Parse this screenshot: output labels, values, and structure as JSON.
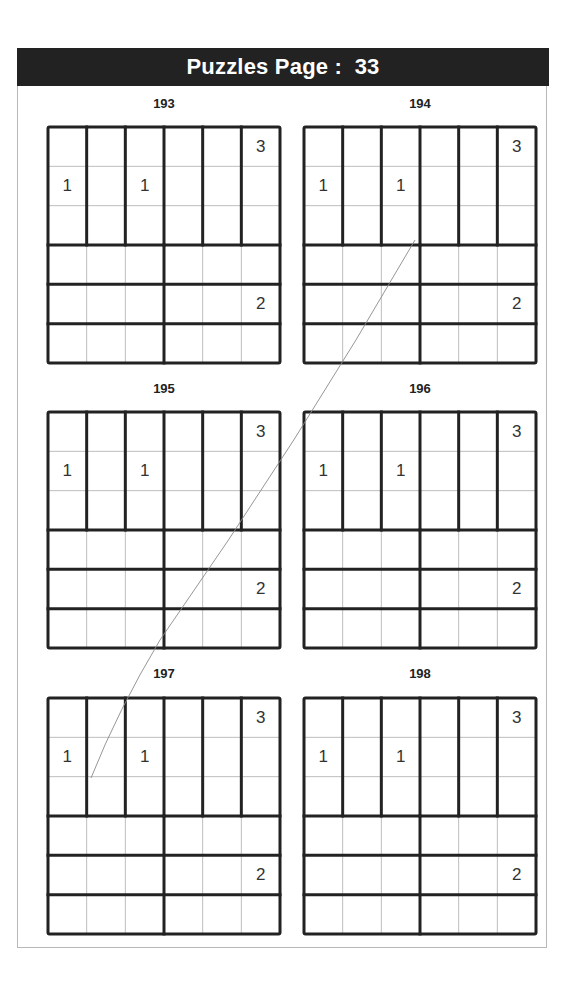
{
  "header": {
    "title": "Puzzles Page",
    "separator": " :  ",
    "page_number": "33"
  },
  "puzzle_size": 6,
  "cages": {
    "description": "Top 3 rows: six vertical 3x1 cages (one per column). Bottom 3 rows: each row has two horizontal 1x3 cages (cols 1-3 and cols 4-6)."
  },
  "puzzles": [
    {
      "number": "193",
      "clues": [
        {
          "row": 0,
          "col": 5,
          "value": "3"
        },
        {
          "row": 1,
          "col": 0,
          "value": "1"
        },
        {
          "row": 1,
          "col": 2,
          "value": "1"
        },
        {
          "row": 4,
          "col": 5,
          "value": "2"
        }
      ]
    },
    {
      "number": "194",
      "clues": [
        {
          "row": 0,
          "col": 5,
          "value": "3"
        },
        {
          "row": 1,
          "col": 0,
          "value": "1"
        },
        {
          "row": 1,
          "col": 2,
          "value": "1"
        },
        {
          "row": 4,
          "col": 5,
          "value": "2"
        }
      ]
    },
    {
      "number": "195",
      "clues": [
        {
          "row": 0,
          "col": 5,
          "value": "3"
        },
        {
          "row": 1,
          "col": 0,
          "value": "1"
        },
        {
          "row": 1,
          "col": 2,
          "value": "1"
        },
        {
          "row": 4,
          "col": 5,
          "value": "2"
        }
      ]
    },
    {
      "number": "196",
      "clues": [
        {
          "row": 0,
          "col": 5,
          "value": "3"
        },
        {
          "row": 1,
          "col": 0,
          "value": "1"
        },
        {
          "row": 1,
          "col": 2,
          "value": "1"
        },
        {
          "row": 4,
          "col": 5,
          "value": "2"
        }
      ]
    },
    {
      "number": "197",
      "clues": [
        {
          "row": 0,
          "col": 5,
          "value": "3"
        },
        {
          "row": 1,
          "col": 0,
          "value": "1"
        },
        {
          "row": 1,
          "col": 2,
          "value": "1"
        },
        {
          "row": 4,
          "col": 5,
          "value": "2"
        }
      ]
    },
    {
      "number": "198",
      "clues": [
        {
          "row": 0,
          "col": 5,
          "value": "3"
        },
        {
          "row": 1,
          "col": 0,
          "value": "1"
        },
        {
          "row": 1,
          "col": 2,
          "value": "1"
        },
        {
          "row": 4,
          "col": 5,
          "value": "2"
        }
      ]
    }
  ],
  "colors": {
    "header_bg": "#222222",
    "header_text": "#ffffff",
    "thick_line": "#222222",
    "thin_line": "#bdbdbd",
    "clue_text": "#333333",
    "stray_stroke": "#888888"
  }
}
